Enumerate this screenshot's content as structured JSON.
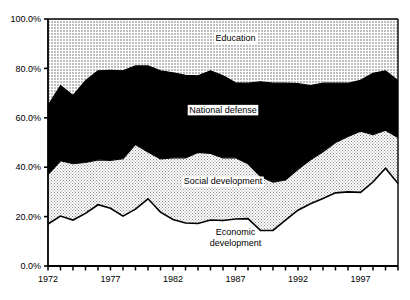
{
  "chart_data": {
    "type": "area",
    "title": "",
    "subtitle": "",
    "xlabel": "",
    "ylabel": "",
    "stacked": true,
    "grid": false,
    "legend_position": "inline-annotations",
    "xlim": [
      1972,
      2000
    ],
    "ylim": [
      0,
      100
    ],
    "y_ticks": [
      0,
      20,
      40,
      60,
      80,
      100
    ],
    "y_tick_labels": [
      "0.0%",
      "20.0%",
      "40.0%",
      "60.0%",
      "80.0%",
      "100.0%"
    ],
    "x_ticks": [
      1972,
      1973,
      1974,
      1975,
      1976,
      1977,
      1978,
      1979,
      1980,
      1981,
      1982,
      1983,
      1984,
      1985,
      1986,
      1987,
      1988,
      1989,
      1990,
      1991,
      1992,
      1993,
      1994,
      1995,
      1996,
      1997,
      1998,
      1999,
      2000
    ],
    "x_tick_labels": [
      "1972",
      "1977",
      "1982",
      "1987",
      "1992",
      "1997"
    ],
    "x_labeled_ticks": [
      1972,
      1977,
      1982,
      1987,
      1992,
      1997
    ],
    "x": [
      1972,
      1973,
      1974,
      1975,
      1976,
      1977,
      1978,
      1979,
      1980,
      1981,
      1982,
      1983,
      1984,
      1985,
      1986,
      1987,
      1988,
      1989,
      1990,
      1991,
      1992,
      1993,
      1994,
      1995,
      1996,
      1997,
      1998,
      1999,
      2000
    ],
    "series": [
      {
        "name": "Economic development",
        "fill": "#ffffff",
        "pattern": "solid-white",
        "values": [
          17.0,
          20.2,
          18.6,
          21.3,
          24.8,
          23.4,
          20.2,
          23.0,
          27.2,
          21.8,
          18.8,
          17.4,
          17.2,
          18.6,
          18.4,
          19.0,
          19.2,
          14.4,
          14.4,
          18.6,
          22.6,
          25.2,
          27.3,
          29.6,
          30.0,
          29.8,
          34.0,
          39.6,
          33.4
        ]
      },
      {
        "name": "Social development",
        "fill": "#d9d9d9",
        "pattern": "dotted-light",
        "values": [
          20.0,
          22.4,
          22.8,
          20.6,
          18.2,
          19.4,
          23.2,
          26.2,
          19.0,
          21.6,
          25.0,
          26.4,
          28.8,
          27.0,
          25.4,
          24.8,
          22.2,
          21.8,
          19.6,
          16.2,
          16.6,
          17.8,
          19.0,
          20.4,
          22.4,
          24.8,
          19.2,
          15.4,
          18.6
        ]
      },
      {
        "name": "National defense",
        "fill": "#000000",
        "pattern": "solid-black",
        "values": [
          28.0,
          30.4,
          27.6,
          33.1,
          36.0,
          36.4,
          35.6,
          31.8,
          34.8,
          35.6,
          34.4,
          33.4,
          31.0,
          33.4,
          33.2,
          30.4,
          32.6,
          38.4,
          40.0,
          39.2,
          34.6,
          30.0,
          27.7,
          24.0,
          21.6,
          20.6,
          24.8,
          24.0,
          23.0
        ]
      },
      {
        "name": "Education",
        "fill": "#c8c8c8",
        "pattern": "dotted-gray",
        "values": [
          35.0,
          27.0,
          31.0,
          25.0,
          21.0,
          20.8,
          21.0,
          19.0,
          19.0,
          21.0,
          21.8,
          22.8,
          23.0,
          21.0,
          23.0,
          25.8,
          26.0,
          25.4,
          26.0,
          26.0,
          26.2,
          27.0,
          26.0,
          26.0,
          26.0,
          24.8,
          22.0,
          21.0,
          25.0
        ]
      }
    ],
    "cumulative_boundaries": {
      "economic_top": [
        17.0,
        20.2,
        18.6,
        21.3,
        24.8,
        23.4,
        20.2,
        23.0,
        27.2,
        21.8,
        18.8,
        17.4,
        17.2,
        18.6,
        18.4,
        19.0,
        19.2,
        14.4,
        14.4,
        18.6,
        22.6,
        25.2,
        27.3,
        29.6,
        30.0,
        29.8,
        34.0,
        39.6,
        33.4
      ],
      "social_top": [
        37.0,
        42.6,
        41.4,
        41.9,
        43.0,
        42.8,
        43.4,
        49.2,
        46.2,
        43.4,
        43.8,
        43.8,
        46.0,
        45.6,
        43.8,
        43.8,
        41.4,
        36.2,
        34.0,
        34.8,
        39.2,
        43.0,
        46.3,
        50.0,
        52.4,
        54.6,
        53.2,
        55.0,
        52.0
      ],
      "defense_top": [
        65.0,
        73.0,
        69.0,
        75.0,
        79.0,
        79.2,
        79.0,
        81.0,
        81.0,
        79.0,
        78.2,
        77.2,
        77.0,
        79.0,
        77.0,
        74.2,
        74.0,
        74.6,
        74.0,
        74.0,
        73.8,
        73.0,
        74.0,
        74.0,
        74.0,
        75.2,
        78.0,
        79.0,
        75.0
      ],
      "education_top": [
        100,
        100,
        100,
        100,
        100,
        100,
        100,
        100,
        100,
        100,
        100,
        100,
        100,
        100,
        100,
        100,
        100,
        100,
        100,
        100,
        100,
        100,
        100,
        100,
        100,
        100,
        100,
        100,
        100
      ]
    },
    "annotations": [
      {
        "text": "Education",
        "x": 1987,
        "y": 91,
        "style": "on-light"
      },
      {
        "text": "National defense",
        "x": 1986,
        "y": 62,
        "style": "boxed-on-dark"
      },
      {
        "text": "Social development",
        "x": 1986,
        "y": 33,
        "style": "on-light"
      },
      {
        "text": "Economic development",
        "x": 1987,
        "y": 14,
        "style": "on-white",
        "lines": [
          "Economic",
          "development"
        ]
      }
    ]
  },
  "axes": {
    "y_tick_labels": [
      "100.0%",
      "80.0%",
      "60.0%",
      "40.0%",
      "20.0%",
      "0.0%"
    ],
    "x_tick_labels": [
      "1972",
      "1977",
      "1982",
      "1987",
      "1992",
      "1997"
    ]
  },
  "labels": {
    "education": "Education",
    "national_defense": "National defense",
    "social_development": "Social development",
    "economic_development_line1": "Economic",
    "economic_development_line2": "development"
  },
  "colors": {
    "education_fill": "#c8c8c8",
    "defense_fill": "#000000",
    "social_fill": "#dcdcdc",
    "economic_fill": "#ffffff",
    "axis": "#000000",
    "background": "#ffffff"
  }
}
